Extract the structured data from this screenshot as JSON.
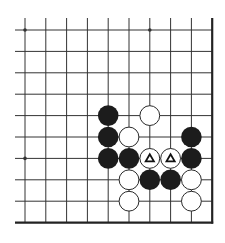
{
  "diagram": {
    "board": {
      "columns": 10,
      "rows": 10,
      "origin_x": 25,
      "origin_y": 30,
      "spacing_x": 20.8,
      "spacing_y": 21.4,
      "line_extend_left": 10,
      "line_extend_top": 12,
      "edges": [
        "right",
        "bottom"
      ],
      "line_color": "#333333",
      "edge_color": "#222222",
      "background": "#ffffff"
    },
    "star_points": [
      {
        "col": 0,
        "row": 0
      },
      {
        "col": 6,
        "row": 0
      },
      {
        "col": 0,
        "row": 6
      }
    ],
    "stones": [
      {
        "color": "black",
        "col": 4,
        "row": 4
      },
      {
        "color": "white",
        "col": 6,
        "row": 4
      },
      {
        "color": "black",
        "col": 4,
        "row": 5
      },
      {
        "color": "white",
        "col": 5,
        "row": 5
      },
      {
        "color": "black",
        "col": 8,
        "row": 5
      },
      {
        "color": "black",
        "col": 4,
        "row": 6
      },
      {
        "color": "black",
        "col": 5,
        "row": 6
      },
      {
        "color": "white",
        "col": 6,
        "row": 6,
        "mark": "triangle"
      },
      {
        "color": "white",
        "col": 7,
        "row": 6,
        "mark": "triangle"
      },
      {
        "color": "black",
        "col": 8,
        "row": 6
      },
      {
        "color": "white",
        "col": 5,
        "row": 7
      },
      {
        "color": "black",
        "col": 6,
        "row": 7
      },
      {
        "color": "black",
        "col": 7,
        "row": 7
      },
      {
        "color": "white",
        "col": 8,
        "row": 7
      },
      {
        "color": "white",
        "col": 5,
        "row": 8
      },
      {
        "color": "white",
        "col": 8,
        "row": 8
      }
    ],
    "colors": {
      "black_stone": "#1c1c1c",
      "white_stone": "#ffffff",
      "white_outline": "#2a2a2a",
      "mark": "#111111"
    },
    "marks_legend": {
      "triangle": "marked stone"
    }
  }
}
